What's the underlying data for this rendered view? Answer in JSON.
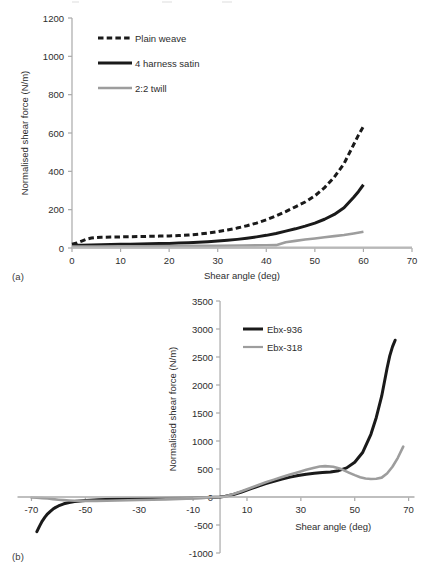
{
  "figure": {
    "panel_a_label": "(a)",
    "panel_b_label": "(b)"
  },
  "chart_data": [
    {
      "id": "chart-a",
      "type": "line",
      "title": "",
      "subtitle": "",
      "xlabel": "Shear angle (deg)",
      "ylabel": "Normalised shear force (N/m)",
      "xlim": [
        0,
        70
      ],
      "ylim": [
        0,
        1200
      ],
      "xticks": [
        0,
        10,
        20,
        30,
        40,
        50,
        60,
        70
      ],
      "yticks": [
        0,
        200,
        400,
        600,
        800,
        1000,
        1200
      ],
      "xtick_labels": [
        "0",
        "10",
        "20",
        "30",
        "40",
        "50",
        "60",
        "70"
      ],
      "ytick_labels": [
        "0",
        "200",
        "400",
        "600",
        "800",
        "1000",
        "1200"
      ],
      "grid": false,
      "legend_position": "upper-left",
      "series": [
        {
          "name": "Plain weave",
          "color": "#1a1a1a",
          "style": "dashed",
          "width": 3.0,
          "x": [
            0,
            1,
            2,
            3,
            4,
            5,
            6,
            8,
            10,
            12,
            14,
            16,
            18,
            20,
            22,
            24,
            26,
            28,
            30,
            32,
            34,
            36,
            38,
            40,
            42,
            44,
            46,
            48,
            50,
            52,
            54,
            56,
            58,
            59,
            60
          ],
          "y": [
            20,
            26,
            36,
            46,
            52,
            55,
            56,
            57,
            58,
            59,
            60,
            61,
            62,
            63,
            65,
            68,
            72,
            78,
            85,
            94,
            104,
            116,
            130,
            147,
            167,
            190,
            215,
            240,
            272,
            315,
            370,
            440,
            540,
            590,
            635
          ]
        },
        {
          "name": "4 harness satin",
          "color": "#1a1a1a",
          "style": "solid",
          "width": 3.0,
          "x": [
            0,
            2,
            4,
            6,
            8,
            10,
            12,
            14,
            16,
            18,
            20,
            22,
            24,
            26,
            28,
            30,
            32,
            34,
            36,
            38,
            40,
            42,
            44,
            46,
            48,
            50,
            52,
            54,
            56,
            58,
            59,
            60
          ],
          "y": [
            14,
            15,
            16,
            17,
            18,
            19,
            20,
            21,
            22,
            23,
            24,
            26,
            28,
            30,
            33,
            36,
            40,
            45,
            51,
            58,
            66,
            76,
            88,
            100,
            114,
            130,
            150,
            175,
            210,
            265,
            295,
            330
          ]
        },
        {
          "name": "2:2 twill",
          "color": "#9d9d9d",
          "style": "solid",
          "width": 2.6,
          "x": [
            0,
            5,
            10,
            15,
            20,
            25,
            30,
            35,
            40,
            42,
            44,
            46,
            48,
            50,
            52,
            54,
            56,
            58,
            60
          ],
          "y": [
            8,
            8,
            9,
            9,
            10,
            11,
            12,
            13,
            14,
            15,
            30,
            37,
            44,
            50,
            56,
            62,
            68,
            76,
            85
          ]
        },
        {
          "name": "baseline",
          "color": "#b8b8b8",
          "style": "solid",
          "width": 2.2,
          "x": [
            0,
            70
          ],
          "y": [
            2,
            2
          ]
        }
      ],
      "legend": [
        {
          "label": "Plain weave",
          "color": "#1a1a1a",
          "style": "dashed"
        },
        {
          "label": "4 harness satin",
          "color": "#1a1a1a",
          "style": "solid"
        },
        {
          "label": "2:2 twill",
          "color": "#9d9d9d",
          "style": "solid"
        }
      ]
    },
    {
      "id": "chart-b",
      "type": "line",
      "title": "",
      "subtitle": "",
      "xlabel": "Shear angle (deg)",
      "ylabel": "Normalised shear force (N/m)",
      "xlim": [
        -75,
        72
      ],
      "ylim": [
        -1000,
        3500
      ],
      "xticks": [
        -70,
        -50,
        -30,
        -10,
        10,
        30,
        50,
        70
      ],
      "yticks": [
        -1000,
        -500,
        0,
        500,
        1000,
        1500,
        2000,
        2500,
        3000,
        3500
      ],
      "xtick_labels": [
        "-70",
        "-50",
        "-30",
        "-10",
        "10",
        "30",
        "50",
        "70"
      ],
      "ytick_labels": [
        "-1000",
        "-500",
        "0",
        "500",
        "1000",
        "1500",
        "2000",
        "2500",
        "3000",
        "3500"
      ],
      "grid": false,
      "legend_position": "upper-right",
      "series": [
        {
          "name": "Ebx-936",
          "color": "#1a1a1a",
          "style": "solid",
          "width": 3.0,
          "x": [
            -68,
            -67,
            -66,
            -65,
            -64,
            -63,
            -62,
            -61,
            -60,
            -58,
            -56,
            -54,
            -52,
            -50,
            -45,
            -40,
            -35,
            -30,
            -25,
            -20,
            -15,
            -10,
            -5,
            -2,
            0,
            2,
            5,
            8,
            11,
            14,
            17,
            20,
            23,
            26,
            29,
            32,
            35,
            38,
            41,
            44,
            47,
            50,
            53,
            56,
            58,
            60,
            62,
            63,
            64,
            65
          ],
          "y": [
            -620,
            -520,
            -430,
            -360,
            -300,
            -255,
            -215,
            -185,
            -160,
            -122,
            -98,
            -82,
            -70,
            -62,
            -48,
            -40,
            -34,
            -30,
            -26,
            -22,
            -18,
            -14,
            -8,
            -4,
            0,
            12,
            45,
            90,
            140,
            190,
            238,
            282,
            320,
            355,
            385,
            408,
            424,
            436,
            448,
            470,
            520,
            620,
            800,
            1120,
            1420,
            1800,
            2300,
            2520,
            2680,
            2800
          ]
        },
        {
          "name": "Ebx-318",
          "color": "#9d9d9d",
          "style": "solid",
          "width": 2.6,
          "x": [
            -70,
            -68,
            -66,
            -64,
            -62,
            -60,
            -58,
            -56,
            -54,
            -52,
            -50,
            -46,
            -42,
            -38,
            -34,
            -30,
            -25,
            -20,
            -15,
            -10,
            -5,
            -2,
            0,
            2,
            5,
            8,
            11,
            14,
            17,
            20,
            23,
            26,
            29,
            32,
            35,
            37,
            39,
            42,
            45,
            48,
            50,
            52,
            54,
            56,
            58,
            60,
            62,
            64,
            66,
            68
          ],
          "y": [
            -10,
            -14,
            -20,
            -28,
            -38,
            -48,
            -56,
            -62,
            -66,
            -68,
            -70,
            -70,
            -66,
            -62,
            -58,
            -54,
            -48,
            -42,
            -36,
            -28,
            -14,
            -5,
            0,
            14,
            52,
            102,
            156,
            210,
            262,
            310,
            356,
            400,
            444,
            486,
            524,
            544,
            552,
            540,
            498,
            432,
            390,
            352,
            330,
            322,
            326,
            346,
            420,
            540,
            700,
            900
          ]
        },
        {
          "name": "baseline",
          "color": "#b8b8b8",
          "style": "solid",
          "width": 1.6,
          "x": [
            -75,
            72
          ],
          "y": [
            0,
            0
          ]
        }
      ],
      "legend": [
        {
          "label": "Ebx-936",
          "color": "#1a1a1a",
          "style": "solid"
        },
        {
          "label": "Ebx-318",
          "color": "#9d9d9d",
          "style": "solid"
        }
      ]
    }
  ]
}
